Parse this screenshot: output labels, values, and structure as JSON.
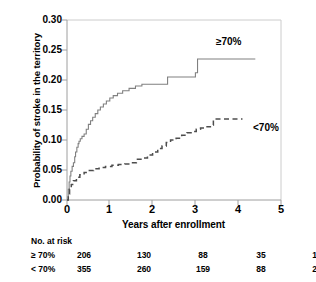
{
  "chart_data": {
    "type": "line",
    "title": "",
    "xlabel": "Years after enrollment",
    "ylabel": "Probability of stroke in the territory",
    "xlim": [
      0,
      5
    ],
    "ylim": [
      0.0,
      0.3
    ],
    "xticks": [
      0,
      1,
      2,
      3,
      4,
      5
    ],
    "xtick_labels": [
      "0",
      "1",
      "2",
      "3",
      "4",
      "5"
    ],
    "yticks": [
      0.0,
      0.05,
      0.1,
      0.15,
      0.2,
      0.25,
      0.3
    ],
    "ytick_labels": [
      "0.00",
      "0.05",
      "0.10",
      "0.15",
      "0.20",
      "0.25",
      "0.30"
    ],
    "grid": false,
    "legend_position": "inline-annotation",
    "curve_style": "kaplan-meier-step",
    "series": [
      {
        "name": "≥70%",
        "label": "≥70%",
        "linestyle": "solid",
        "color": "#808080",
        "annotation": "≥70%",
        "final_value": 0.235,
        "points": [
          [
            0.0,
            0.0
          ],
          [
            0.03,
            0.018
          ],
          [
            0.05,
            0.03
          ],
          [
            0.07,
            0.04
          ],
          [
            0.09,
            0.048
          ],
          [
            0.12,
            0.056
          ],
          [
            0.15,
            0.062
          ],
          [
            0.18,
            0.072
          ],
          [
            0.2,
            0.08
          ],
          [
            0.23,
            0.088
          ],
          [
            0.26,
            0.094
          ],
          [
            0.28,
            0.098
          ],
          [
            0.31,
            0.102
          ],
          [
            0.35,
            0.106
          ],
          [
            0.4,
            0.11
          ],
          [
            0.45,
            0.118
          ],
          [
            0.5,
            0.126
          ],
          [
            0.55,
            0.132
          ],
          [
            0.6,
            0.138
          ],
          [
            0.66,
            0.144
          ],
          [
            0.72,
            0.15
          ],
          [
            0.78,
            0.155
          ],
          [
            0.85,
            0.16
          ],
          [
            0.92,
            0.165
          ],
          [
            1.0,
            0.17
          ],
          [
            1.08,
            0.174
          ],
          [
            1.18,
            0.178
          ],
          [
            1.3,
            0.182
          ],
          [
            1.45,
            0.186
          ],
          [
            1.6,
            0.19
          ],
          [
            1.75,
            0.193
          ],
          [
            2.3,
            0.193
          ],
          [
            2.35,
            0.205
          ],
          [
            2.95,
            0.205
          ],
          [
            3.0,
            0.212
          ],
          [
            3.05,
            0.235
          ],
          [
            4.4,
            0.235
          ]
        ]
      },
      {
        "name": "<70%",
        "label": "<70%",
        "linestyle": "dashed",
        "color": "#4d4d4d",
        "annotation": "<70%",
        "final_value": 0.135,
        "points": [
          [
            0.0,
            0.0
          ],
          [
            0.03,
            0.01
          ],
          [
            0.06,
            0.018
          ],
          [
            0.1,
            0.026
          ],
          [
            0.15,
            0.032
          ],
          [
            0.22,
            0.038
          ],
          [
            0.3,
            0.042
          ],
          [
            0.4,
            0.046
          ],
          [
            0.5,
            0.049
          ],
          [
            0.62,
            0.052
          ],
          [
            0.75,
            0.054
          ],
          [
            0.9,
            0.056
          ],
          [
            1.05,
            0.058
          ],
          [
            1.2,
            0.059
          ],
          [
            1.35,
            0.06
          ],
          [
            1.5,
            0.062
          ],
          [
            1.62,
            0.068
          ],
          [
            1.75,
            0.07
          ],
          [
            1.88,
            0.075
          ],
          [
            2.0,
            0.08
          ],
          [
            2.12,
            0.086
          ],
          [
            2.22,
            0.09
          ],
          [
            2.32,
            0.096
          ],
          [
            2.42,
            0.1
          ],
          [
            2.55,
            0.103
          ],
          [
            2.68,
            0.108
          ],
          [
            2.8,
            0.112
          ],
          [
            2.92,
            0.114
          ],
          [
            3.02,
            0.118
          ],
          [
            3.12,
            0.12
          ],
          [
            3.22,
            0.122
          ],
          [
            3.35,
            0.125
          ],
          [
            3.42,
            0.135
          ],
          [
            4.1,
            0.135
          ]
        ]
      }
    ],
    "risk_table": {
      "title": "No. at risk",
      "times": [
        0,
        1,
        2,
        3,
        4
      ],
      "rows": [
        {
          "label": "≥ 70%",
          "values": [
            "206",
            "130",
            "88",
            "35",
            "10"
          ]
        },
        {
          "label": "< 70%",
          "values": [
            "355",
            "260",
            "159",
            "88",
            "24"
          ]
        }
      ]
    }
  },
  "colors": {
    "axis": "#b3b3b3",
    "frame": "#cccccc",
    "text": "#000000",
    "series_high": "#808080",
    "series_low": "#4d4d4d",
    "background": "#ffffff"
  }
}
